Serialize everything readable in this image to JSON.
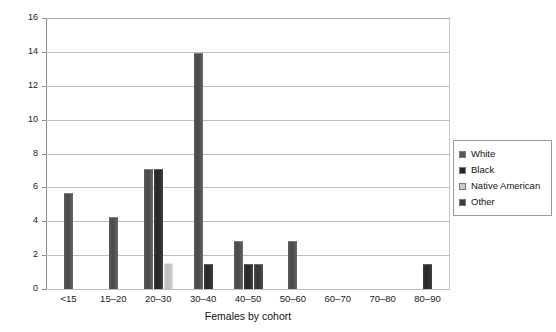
{
  "chart_data": {
    "type": "bar",
    "title": "",
    "xlabel": "Females by cohort",
    "ylabel": "",
    "categories": [
      "<15",
      "15–20",
      "20–30",
      "30–40",
      "40–50",
      "50–60",
      "60–70",
      "70–80",
      "80–90"
    ],
    "ylim": [
      0,
      16
    ],
    "yticks": [
      0,
      2,
      4,
      6,
      8,
      10,
      12,
      14,
      16
    ],
    "grid": true,
    "legend_position": "right",
    "series": [
      {
        "name": "White",
        "color": "#5a5a5a",
        "values": [
          5.6,
          4.2,
          7.0,
          13.9,
          2.8,
          2.8,
          0,
          0,
          0
        ]
      },
      {
        "name": "Black",
        "color": "#262626",
        "values": [
          0,
          0,
          7.0,
          1.4,
          1.4,
          0,
          0,
          0,
          1.4
        ]
      },
      {
        "name": "Native American",
        "color": "#c9c9c9",
        "values": [
          0,
          0,
          1.5,
          0,
          0,
          0,
          0,
          0,
          0
        ]
      },
      {
        "name": "Other",
        "color": "#3c3c3c",
        "values": [
          0,
          0,
          0,
          0,
          1.4,
          0,
          0,
          0,
          0
        ]
      }
    ]
  },
  "legend": {
    "items": [
      {
        "label": "White"
      },
      {
        "label": "Black"
      },
      {
        "label": "Native American"
      },
      {
        "label": "Other"
      }
    ]
  }
}
